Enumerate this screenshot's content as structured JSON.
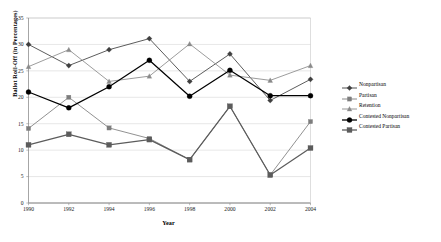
{
  "chart_data": {
    "type": "line",
    "title": "",
    "xlabel": "Year",
    "ylabel": "Ballot Roll-Off (in Percentages)",
    "x": [
      1990,
      1992,
      1994,
      1996,
      1998,
      2000,
      2002,
      2004
    ],
    "xtick_labels": [
      "1990",
      "1992",
      "1994",
      "1996",
      "1998",
      "2000",
      "2002",
      "2004"
    ],
    "ytick_labels": [
      "0",
      "5",
      "10",
      "15",
      "20",
      "25",
      "30",
      "35"
    ],
    "yticks": [
      0,
      5,
      10,
      15,
      20,
      25,
      30,
      35
    ],
    "ylim": [
      0,
      35
    ],
    "xlim": [
      1990,
      2004
    ],
    "grid": "horizontal",
    "legend_position": "right",
    "series": [
      {
        "name": "Nonpartisan",
        "marker": "diamond",
        "color": "#3f3f3f",
        "values": [
          30.0,
          26.0,
          29.0,
          31.1,
          23.0,
          28.2,
          19.4,
          23.4
        ]
      },
      {
        "name": "Partisan",
        "marker": "square",
        "color": "#7d7d7d",
        "values": [
          14.1,
          20.0,
          14.2,
          12.2,
          8.2,
          18.3,
          5.3,
          15.4
        ]
      },
      {
        "name": "Retention",
        "marker": "triangle",
        "color": "#8a8a8a",
        "values": [
          25.8,
          29.0,
          23.0,
          24.0,
          30.1,
          24.2,
          23.2,
          26.0
        ]
      },
      {
        "name": "Contested Nonpartisan",
        "marker": "circle",
        "color": "#000000",
        "values": [
          21.0,
          18.0,
          22.0,
          27.0,
          20.2,
          25.1,
          20.3,
          20.3
        ]
      },
      {
        "name": "Contested Partisan",
        "marker": "square",
        "color": "#5c5c5c",
        "values": [
          11.0,
          13.0,
          11.0,
          12.0,
          8.2,
          18.3,
          5.3,
          10.4
        ]
      }
    ]
  }
}
